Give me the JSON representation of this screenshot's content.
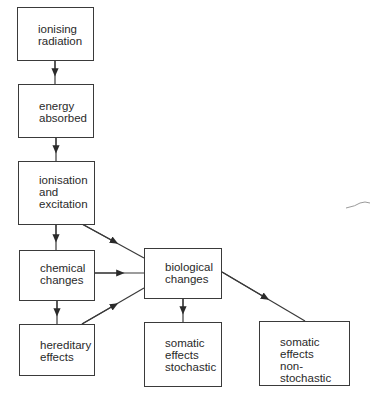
{
  "diagram": {
    "type": "flowchart",
    "nodes": [
      {
        "id": "ionising-radiation",
        "label": "ionising\nradiation"
      },
      {
        "id": "energy-absorbed",
        "label": "energy\nabsorbed"
      },
      {
        "id": "ionisation-excitation",
        "label": "ionisation\nand\nexcitation"
      },
      {
        "id": "chemical-changes",
        "label": "chemical\nchanges"
      },
      {
        "id": "hereditary-effects",
        "label": "hereditary\neffects"
      },
      {
        "id": "biological-changes",
        "label": "biological\nchanges"
      },
      {
        "id": "somatic-stochastic",
        "label": "somatic\neffects\nstochastic"
      },
      {
        "id": "somatic-non-stochastic",
        "label": "somatic\neffects\nnon-stochastic"
      }
    ],
    "edges": [
      {
        "from": "ionising-radiation",
        "to": "energy-absorbed"
      },
      {
        "from": "energy-absorbed",
        "to": "ionisation-excitation"
      },
      {
        "from": "ionisation-excitation",
        "to": "chemical-changes"
      },
      {
        "from": "ionisation-excitation",
        "to": "biological-changes"
      },
      {
        "from": "chemical-changes",
        "to": "biological-changes"
      },
      {
        "from": "chemical-changes",
        "to": "hereditary-effects"
      },
      {
        "from": "hereditary-effects",
        "to": "biological-changes"
      },
      {
        "from": "biological-changes",
        "to": "somatic-stochastic"
      },
      {
        "from": "biological-changes",
        "to": "somatic-non-stochastic"
      }
    ]
  }
}
